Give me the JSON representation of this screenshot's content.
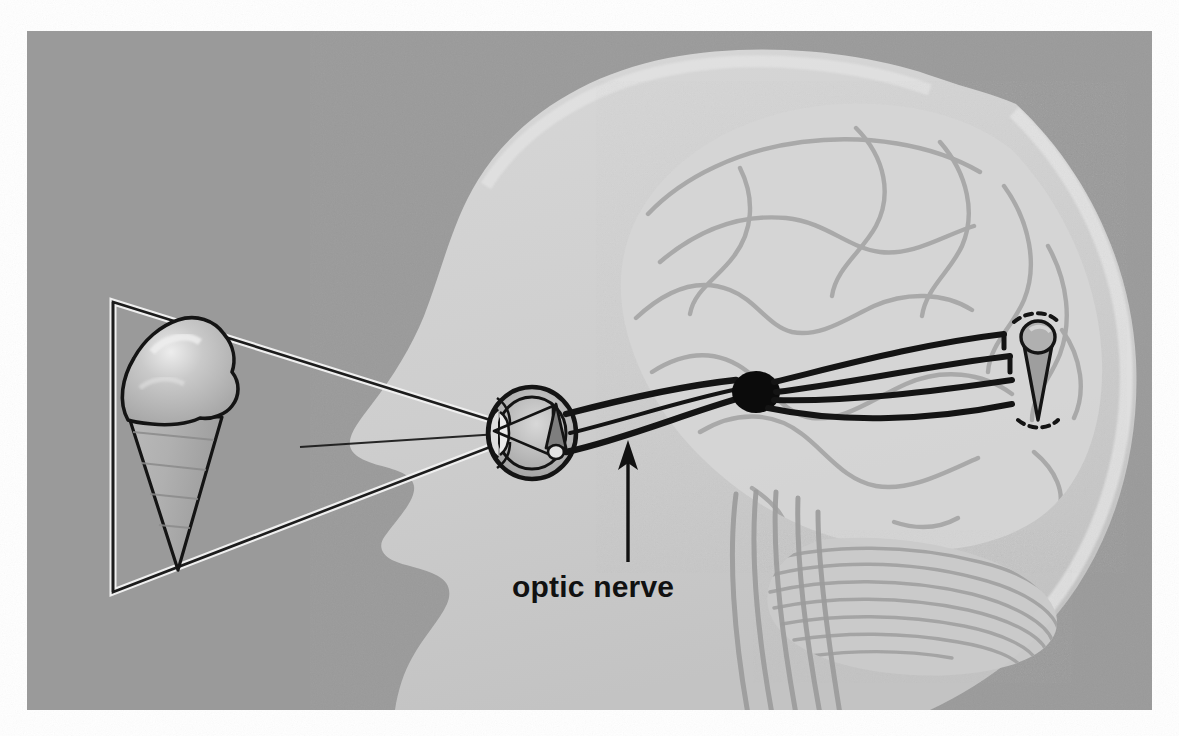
{
  "figure": {
    "kind": "anatomical-illustration",
    "canvas": {
      "width": 1179,
      "height": 736,
      "background_color": "#ffffff"
    },
    "plate": {
      "x": 27,
      "y": 31,
      "width": 1125,
      "height": 679,
      "background_color": "#9a9a9a",
      "description": "gray photographic plate area"
    }
  },
  "labels": [
    {
      "id": "optic-nerve",
      "text": "optic nerve",
      "x": 512,
      "y": 597,
      "color": "#111111",
      "font_size": 30,
      "leader_arrow": {
        "from_x": 628,
        "from_y": 562,
        "to_x": 628,
        "to_y": 445,
        "head": "up",
        "color": "#111111"
      }
    }
  ],
  "parts": [
    {
      "id": "head-profile",
      "name": "human head profile, facing left",
      "fill_color": "#cdcdcd"
    },
    {
      "id": "brain",
      "name": "cerebrum with gyri and sulci",
      "fill_color": "#d4d4d4",
      "line_color": "#a2a2a2"
    },
    {
      "id": "cerebellum",
      "name": "cerebellum with folia",
      "fill_color": "#c9c9c9",
      "line_color": "#9f9f9f"
    },
    {
      "id": "brainstem",
      "name": "brainstem / spinal cord",
      "fill_color": "#cccccc",
      "line_color": "#9b9b9b"
    },
    {
      "id": "eyeball",
      "name": "eyeball with lens, cornea and retina",
      "line_color": "#141414"
    },
    {
      "id": "retinal-image",
      "name": "inverted ice cream cone image on retina",
      "line_color": "#141414"
    },
    {
      "id": "optic-nerve-bundle",
      "name": "optic nerve fiber bundle (three lines)",
      "line_color": "#141414"
    },
    {
      "id": "optic-chiasm",
      "name": "optic chiasm, solid black node",
      "fill_color": "#0b0b0b"
    },
    {
      "id": "optic-radiation",
      "name": "optic radiation fanning to occipital lobe",
      "line_color": "#141414"
    },
    {
      "id": "visual-cortex-image",
      "name": "upright ice cream cone percept in visual cortex, dashed outline",
      "line_color": "#141414"
    },
    {
      "id": "light-ray-cone",
      "name": "triangular light ray cone from object to eye",
      "line_color": "#1a1a1a"
    },
    {
      "id": "object-ice-cream-cone",
      "name": "ice cream cone object viewed",
      "line_color": "#141414",
      "fill_color": "#b8b8b8"
    }
  ],
  "colors": {
    "plate_gray": "#9a9a9a",
    "head_gray": "#cdcdcd",
    "brain_gray": "#d4d4d4",
    "ink_black": "#141414",
    "paper_white": "#ffffff",
    "scoop_highlight": "#e8e8e8"
  }
}
